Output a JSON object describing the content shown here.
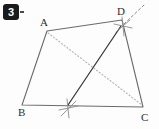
{
  "canvas": {
    "width": 159,
    "height": 129,
    "background": "#fdfdfd"
  },
  "badge": {
    "label": "3",
    "background": "#1b1b1b",
    "text_color": "#ffffff",
    "tick_color": "#4a4a4a"
  },
  "figure": {
    "kind": "geometry-construction",
    "stroke_color": "#6b6b6b",
    "solid_line_color": "#3a3a3a",
    "dotted_color": "#b5b5b5",
    "construction_color": "#8a8a8a",
    "vertices": [
      {
        "name": "A",
        "x": 47,
        "y": 31,
        "label": "A",
        "label_x": 40,
        "label_y": 17
      },
      {
        "name": "B",
        "x": 22,
        "y": 105,
        "label": "B",
        "label_x": 18,
        "label_y": 107
      },
      {
        "name": "C",
        "x": 143,
        "y": 107,
        "label": "C",
        "label_x": 141,
        "label_y": 112
      },
      {
        "name": "D",
        "x": 122,
        "y": 20,
        "label": "D",
        "label_x": 117,
        "label_y": 6
      }
    ],
    "quad_path": "M47,31 L122,20 L143,107 L22,105 Z",
    "dotted_diagonal": {
      "from": "A",
      "to": "C",
      "x1": 48,
      "y1": 33,
      "x2": 142,
      "y2": 105
    },
    "solid_segment": {
      "from": "D",
      "to": "foot-on-BC",
      "x1": 121,
      "y1": 26,
      "x2": 68,
      "y2": 105
    },
    "construction_marks": [
      {
        "name": "arc-cross-at-D",
        "cx": 123,
        "cy": 26,
        "strokes": [
          {
            "x1": 114,
            "y1": 24,
            "x2": 132,
            "y2": 28
          },
          {
            "x1": 122,
            "y1": 17,
            "x2": 124,
            "y2": 36
          },
          {
            "x1": 116,
            "y1": 32,
            "x2": 130,
            "y2": 20
          }
        ]
      },
      {
        "name": "arc-cross-on-BC",
        "cx": 68,
        "cy": 108,
        "strokes": [
          {
            "x1": 59,
            "y1": 110,
            "x2": 78,
            "y2": 106
          },
          {
            "x1": 67,
            "y1": 99,
            "x2": 69,
            "y2": 118
          },
          {
            "x1": 61,
            "y1": 116,
            "x2": 76,
            "y2": 101
          }
        ]
      }
    ],
    "dashed_ray": {
      "x1": 124,
      "y1": 24,
      "x2": 144,
      "y2": 5
    }
  }
}
